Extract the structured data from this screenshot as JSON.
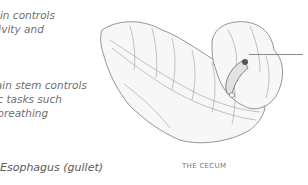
{
  "annotations": {
    "higher_brain": [
      "Brain controls",
      "activity and"
    ],
    "brain_stem": [
      "The brain stem controls",
      "automatic tasks such",
      "as breathing"
    ],
    "esophagus": "Esophagus (gullet)"
  },
  "figure": {
    "caption": "THE CECUM",
    "illustration": "cecum-pencil-drawing"
  }
}
